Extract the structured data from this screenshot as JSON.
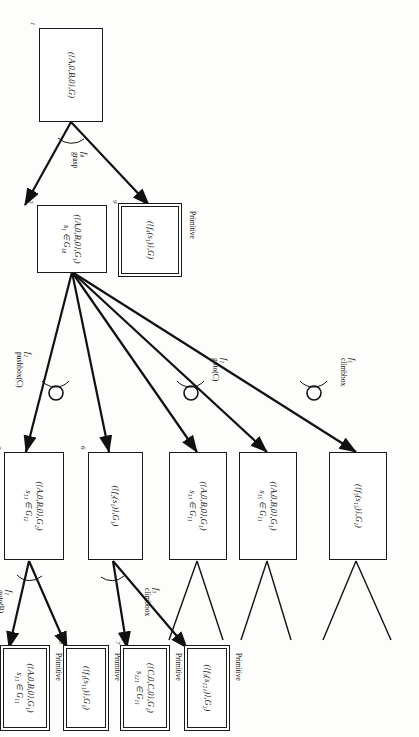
{
  "figure": {
    "type": "and-or task decomposition tree",
    "orientation": "rotated-90-cw",
    "primitive_caption": "Primitive"
  },
  "nodes": [
    {
      "id": "n1",
      "index": "1",
      "line1": "({A,0,B,0},G)",
      "line2": "",
      "primitive": false
    },
    {
      "id": "n2",
      "index": "2",
      "line1": "({A,0,B,0},G₁)",
      "line2": "s₁ ∈ G₁₄",
      "primitive": false
    },
    {
      "id": "n9",
      "index": "9",
      "line1": "({f₄(s₁)},G)",
      "line2": "",
      "primitive": true
    },
    {
      "id": "n3",
      "index": "3",
      "line1": "({A,0,B,0},G₂)",
      "line2": "s₁₁ ∈ G₁₂",
      "primitive": false
    },
    {
      "id": "n6",
      "index": "6",
      "line1": "({f₂(s₁)},G₁)",
      "line2": "",
      "primitive": false
    },
    {
      "id": "n4",
      "index": "4",
      "line1": "({A,0,B,0},G₁)",
      "line2": "s₁₁ ∈ G₁₁",
      "primitive": true
    },
    {
      "id": "n5",
      "index": "5",
      "line1": "({f₁(s₁₁)},G₁)",
      "line2": "",
      "primitive": true
    },
    {
      "id": "n7",
      "index": "7",
      "line1": "({C,0,C,0},G₁)",
      "line2": "s₁₂₁ ∈ G₁₁",
      "primitive": true
    },
    {
      "id": "n8",
      "index": "8",
      "line1": "({f₃(s₁₂₁)},G₂)",
      "line2": "",
      "primitive": true
    },
    {
      "id": "n10",
      "index": "",
      "line1": "({A,0,B,0},G₁)",
      "line2": "s₁₃ ∈ G₁₁",
      "primitive": false
    },
    {
      "id": "n11",
      "index": "",
      "line1": "({f₁(s₁₃)},G₁)",
      "line2": "",
      "primitive": false
    },
    {
      "id": "n12",
      "index": "",
      "line1": "({A,0,B,0},G₁)",
      "line2": "s₁₅ ∈ G₁₁",
      "primitive": false
    },
    {
      "id": "n13",
      "index": "",
      "line1": "({f₅(s₁₅)},G₁)",
      "line2": "",
      "primitive": false
    }
  ],
  "edge_labels": [
    {
      "id": "e4",
      "fn": "f₄",
      "op": "grasp"
    },
    {
      "id": "e2",
      "fn": "f₂",
      "op": "pushbox(C)"
    },
    {
      "id": "e1b",
      "fn": "f₁",
      "op": "goto(B)"
    },
    {
      "id": "e3",
      "fn": "f₃",
      "op": "climbbox"
    },
    {
      "id": "e1c",
      "fn": "f₁",
      "op": "goto(C)"
    },
    {
      "id": "e5",
      "fn": "f₅",
      "op": "climbbox"
    }
  ],
  "colors": {
    "stroke": "#1a1a1a",
    "node_fill": "#ffffff",
    "page": "#fdfdfb"
  }
}
